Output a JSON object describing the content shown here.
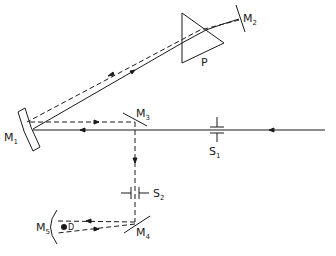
{
  "diagram": {
    "type": "optical-setup",
    "colors": {
      "line": "#1a1a1a",
      "background": "#ffffff"
    },
    "labels": {
      "M1": {
        "main": "M",
        "sub": "1"
      },
      "M2": {
        "main": "M",
        "sub": "2"
      },
      "M3": {
        "main": "M",
        "sub": "3"
      },
      "M4": {
        "main": "M",
        "sub": "4"
      },
      "M5": {
        "main": "M",
        "sub": "5"
      },
      "S1": {
        "main": "S",
        "sub": "1"
      },
      "S2": {
        "main": "S",
        "sub": "2"
      },
      "P": "P",
      "D": "D"
    },
    "components": [
      {
        "id": "M1",
        "kind": "concave-mirror"
      },
      {
        "id": "M2",
        "kind": "plane-mirror"
      },
      {
        "id": "M3",
        "kind": "plane-mirror"
      },
      {
        "id": "M4",
        "kind": "plane-mirror"
      },
      {
        "id": "M5",
        "kind": "concave-mirror"
      },
      {
        "id": "P",
        "kind": "prism"
      },
      {
        "id": "S1",
        "kind": "slit"
      },
      {
        "id": "S2",
        "kind": "slit"
      },
      {
        "id": "D",
        "kind": "detector"
      }
    ],
    "beams": [
      {
        "style": "solid",
        "path": [
          "source",
          "S1",
          "M1",
          "P",
          "M2"
        ]
      },
      {
        "style": "dashed",
        "path": [
          "M2",
          "P",
          "M1",
          "M3",
          "S2",
          "M4",
          "M5",
          "D"
        ]
      }
    ]
  }
}
